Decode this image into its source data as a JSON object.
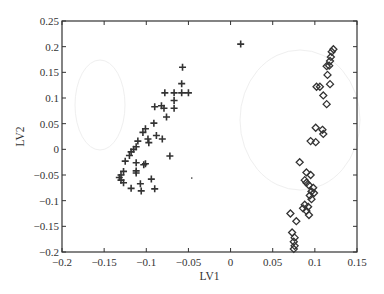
{
  "chart_data": {
    "type": "scatter",
    "title": "",
    "xlabel": "LV1",
    "ylabel": "LV2",
    "xlim": [
      -0.2,
      0.15
    ],
    "ylim": [
      -0.2,
      0.25
    ],
    "grid": false,
    "legend": null,
    "x_ticks": [
      -0.2,
      -0.15,
      -0.1,
      -0.05,
      0,
      0.05,
      0.1,
      0.15
    ],
    "x_tick_labels": [
      "−0.2",
      "−0.15",
      "−0.1",
      "−0.05",
      "0",
      "0.05",
      "0.1",
      "0.15"
    ],
    "y_ticks": [
      0.25,
      0.2,
      0.15,
      0.1,
      0.05,
      0,
      -0.05,
      -0.1,
      -0.15,
      -0.2
    ],
    "y_tick_labels": [
      "0.25",
      "0.2",
      "0.15",
      "0.1",
      "0.05",
      "0",
      "−0.05",
      "−0.1",
      "−0.15",
      "−0.2"
    ],
    "series": [
      {
        "name": "plus",
        "marker": "plus",
        "color": "#333333",
        "points": [
          [
            0.012,
            0.205
          ],
          [
            -0.057,
            0.16
          ],
          [
            -0.058,
            0.128
          ],
          [
            -0.078,
            0.11
          ],
          [
            -0.067,
            0.11
          ],
          [
            -0.058,
            0.11
          ],
          [
            -0.05,
            0.11
          ],
          [
            -0.067,
            0.095
          ],
          [
            -0.067,
            0.08
          ],
          [
            -0.079,
            0.08
          ],
          [
            -0.082,
            0.085
          ],
          [
            -0.09,
            0.083
          ],
          [
            -0.076,
            0.063
          ],
          [
            -0.091,
            0.051
          ],
          [
            -0.101,
            0.04
          ],
          [
            -0.104,
            0.033
          ],
          [
            -0.098,
            0.02
          ],
          [
            -0.097,
            0.013
          ],
          [
            -0.088,
            0.027
          ],
          [
            -0.081,
            0.02
          ],
          [
            -0.072,
            -0.013
          ],
          [
            -0.11,
            0.016
          ],
          [
            -0.112,
            0.005
          ],
          [
            -0.115,
            0.0
          ],
          [
            -0.118,
            -0.005
          ],
          [
            -0.12,
            -0.012
          ],
          [
            -0.125,
            -0.023
          ],
          [
            -0.112,
            -0.026
          ],
          [
            -0.101,
            -0.028
          ],
          [
            -0.103,
            -0.03
          ],
          [
            -0.112,
            -0.042
          ],
          [
            -0.112,
            -0.046
          ],
          [
            -0.127,
            -0.043
          ],
          [
            -0.13,
            -0.05
          ],
          [
            -0.132,
            -0.055
          ],
          [
            -0.13,
            -0.06
          ],
          [
            -0.127,
            -0.065
          ],
          [
            -0.107,
            -0.067
          ],
          [
            -0.094,
            -0.058
          ],
          [
            -0.118,
            -0.076
          ],
          [
            -0.106,
            -0.081
          ],
          [
            -0.09,
            -0.077
          ]
        ]
      },
      {
        "name": "diamond",
        "marker": "diamond",
        "color": "#333333",
        "points": [
          [
            0.122,
            0.195
          ],
          [
            0.12,
            0.19
          ],
          [
            0.119,
            0.18
          ],
          [
            0.118,
            0.172
          ],
          [
            0.117,
            0.163
          ],
          [
            0.114,
            0.162
          ],
          [
            0.115,
            0.145
          ],
          [
            0.118,
            0.127
          ],
          [
            0.102,
            0.122
          ],
          [
            0.106,
            0.122
          ],
          [
            0.11,
            0.105
          ],
          [
            0.114,
            0.088
          ],
          [
            0.101,
            0.042
          ],
          [
            0.109,
            0.038
          ],
          [
            0.11,
            0.03
          ],
          [
            0.095,
            0.016
          ],
          [
            0.101,
            0.014
          ],
          [
            0.082,
            -0.025
          ],
          [
            0.09,
            -0.045
          ],
          [
            0.095,
            -0.05
          ],
          [
            0.088,
            -0.06
          ],
          [
            0.09,
            -0.065
          ],
          [
            0.093,
            -0.07
          ],
          [
            0.098,
            -0.075
          ],
          [
            0.096,
            -0.082
          ],
          [
            0.099,
            -0.085
          ],
          [
            0.094,
            -0.09
          ],
          [
            0.096,
            -0.097
          ],
          [
            0.088,
            -0.108
          ],
          [
            0.092,
            -0.112
          ],
          [
            0.086,
            -0.115
          ],
          [
            0.09,
            -0.12
          ],
          [
            0.093,
            -0.128
          ],
          [
            0.071,
            -0.125
          ],
          [
            0.078,
            -0.14
          ],
          [
            0.073,
            -0.162
          ],
          [
            0.076,
            -0.172
          ],
          [
            0.075,
            -0.18
          ],
          [
            0.076,
            -0.188
          ],
          [
            0.075,
            -0.194
          ]
        ]
      }
    ],
    "annotations": [
      {
        "type": "dot",
        "x": -0.046,
        "y": -0.056
      }
    ]
  },
  "layout": {
    "plot_left": 62,
    "plot_top": 21,
    "plot_right": 357,
    "plot_bottom": 252,
    "axis_color": "#333333"
  }
}
